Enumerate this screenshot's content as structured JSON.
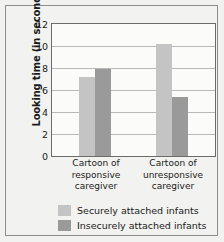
{
  "chart_data": {
    "type": "bar",
    "title": "",
    "xlabel": "",
    "ylabel": "Looking time (in seconds)",
    "categories": [
      "Cartoon of responsive caregiver",
      "Cartoon of unresponsive caregiver"
    ],
    "category_lines": [
      [
        "Cartoon of",
        "responsive",
        "caregiver"
      ],
      [
        "Cartoon of",
        "unresponsive",
        "caregiver"
      ]
    ],
    "series": [
      {
        "name": "Securely attached infants",
        "color": "#c4c4c4",
        "values": [
          7.2,
          10.2
        ]
      },
      {
        "name": "Insecurely attached infants",
        "color": "#9a9a9a",
        "values": [
          7.95,
          5.4
        ]
      }
    ],
    "ylim": [
      0,
      12
    ],
    "yticks": [
      0,
      2,
      4,
      6,
      8,
      10,
      12
    ],
    "ytick_labels": [
      "0",
      "2",
      "4",
      "6",
      "8",
      "10",
      "12"
    ],
    "grid": true,
    "legend_position": "bottom-center"
  },
  "legend": {
    "items": [
      {
        "label": "Securely attached infants",
        "color": "#c4c4c4"
      },
      {
        "label": "Insecurely attached infants",
        "color": "#9a9a9a"
      }
    ]
  }
}
